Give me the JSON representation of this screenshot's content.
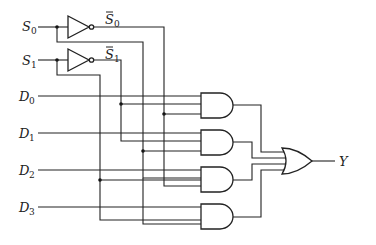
{
  "diagram": {
    "type": "4-to-1 multiplexer logic circuit",
    "select_inputs": [
      {
        "name": "S",
        "sub": "0"
      },
      {
        "name": "S",
        "sub": "1"
      }
    ],
    "inverted_select": [
      {
        "name": "S",
        "sub": "0",
        "bar": true
      },
      {
        "name": "S",
        "sub": "1",
        "bar": true
      }
    ],
    "data_inputs": [
      {
        "name": "D",
        "sub": "0"
      },
      {
        "name": "D",
        "sub": "1"
      },
      {
        "name": "D",
        "sub": "2"
      },
      {
        "name": "D",
        "sub": "3"
      }
    ],
    "output": {
      "name": "Y"
    },
    "gates": {
      "not": 2,
      "and": 4,
      "or": 1
    }
  }
}
